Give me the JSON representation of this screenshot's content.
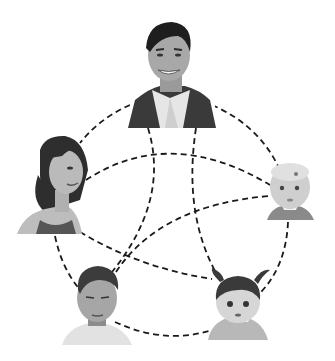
{
  "figure": {
    "description": "Grayscale illustration of five family members connected by dashed curved lines",
    "background": "#ffffff",
    "line_color": "#1a1a1a",
    "people": [
      {
        "id": "father",
        "label": "Man",
        "x": 172,
        "y": 65
      },
      {
        "id": "mother",
        "label": "Woman",
        "x": 48,
        "y": 185
      },
      {
        "id": "baby",
        "label": "Baby",
        "x": 290,
        "y": 195
      },
      {
        "id": "boy",
        "label": "Boy",
        "x": 98,
        "y": 310
      },
      {
        "id": "girl",
        "label": "Toddler girl",
        "x": 238,
        "y": 300
      }
    ],
    "connections": [
      [
        "father",
        "mother"
      ],
      [
        "father",
        "baby"
      ],
      [
        "father",
        "boy"
      ],
      [
        "father",
        "girl"
      ],
      [
        "mother",
        "baby"
      ],
      [
        "mother",
        "girl"
      ],
      [
        "mother",
        "boy"
      ],
      [
        "boy",
        "baby"
      ],
      [
        "boy",
        "girl"
      ],
      [
        "baby",
        "girl"
      ]
    ]
  }
}
